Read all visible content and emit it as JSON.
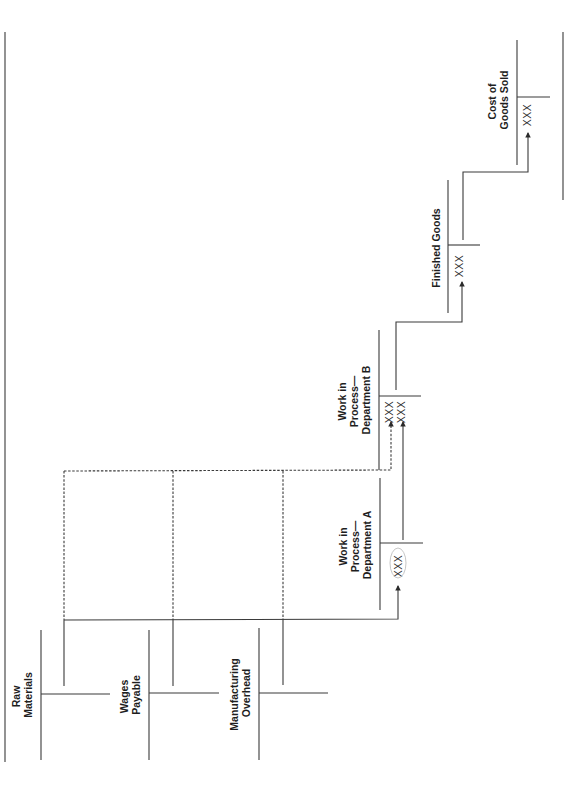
{
  "diagram": {
    "orientation": "rotated-90-ccw",
    "accounts": [
      {
        "id": "raw-materials",
        "label_lines": [
          "Raw",
          "Materials"
        ]
      },
      {
        "id": "wages-payable",
        "label_lines": [
          "Wages",
          "Payable"
        ]
      },
      {
        "id": "manufacturing-overhead",
        "label_lines": [
          "Manufacturing",
          "Overhead"
        ]
      },
      {
        "id": "wip-a",
        "label_lines": [
          "Work in",
          "Process—",
          "Department A"
        ],
        "entries": [
          "XXX"
        ]
      },
      {
        "id": "wip-b",
        "label_lines": [
          "Work in",
          "Process—",
          "Department B"
        ],
        "entries": [
          "XXX",
          "XXX"
        ]
      },
      {
        "id": "finished-goods",
        "label_lines": [
          "Finished Goods"
        ],
        "entries": [
          "XXX"
        ]
      },
      {
        "id": "cogs",
        "label_lines": [
          "Cost of",
          "Goods Sold"
        ],
        "entries": [
          "XXX"
        ]
      }
    ],
    "flows": [
      {
        "from": "raw-materials",
        "to": "wip-a",
        "style": "solid"
      },
      {
        "from": "wages-payable",
        "to": "wip-a",
        "style": "solid"
      },
      {
        "from": "manufacturing-overhead",
        "to": "wip-a",
        "style": "solid"
      },
      {
        "from": "raw-materials",
        "to": "wip-b",
        "style": "dashed"
      },
      {
        "from": "wages-payable",
        "to": "wip-b",
        "style": "dashed"
      },
      {
        "from": "manufacturing-overhead",
        "to": "wip-b",
        "style": "dashed"
      },
      {
        "from": "wip-a",
        "to": "wip-b",
        "style": "solid"
      },
      {
        "from": "wip-b",
        "to": "finished-goods",
        "style": "solid"
      },
      {
        "from": "finished-goods",
        "to": "cogs",
        "style": "solid"
      }
    ],
    "colors": {
      "line": "#3a3a3a",
      "text": "#1e1e1e",
      "background": "#ffffff"
    }
  }
}
